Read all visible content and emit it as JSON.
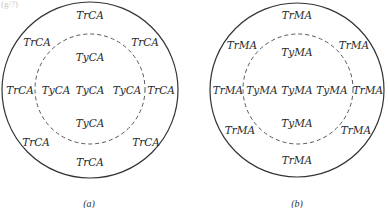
{
  "header_fragment": "(g/?)",
  "panels": [
    {
      "caption": "(a)",
      "outer_label": "TrCA",
      "inner_label": "TyCA",
      "outer_labels": [
        "TrCA",
        "TrCA",
        "TrCA",
        "TrCA",
        "TrCA",
        "TrCA",
        "TrCA",
        "TrCA"
      ],
      "inner_labels": [
        "TyCA",
        "TyCA",
        "TyCA",
        "TyCA",
        "TyCA"
      ]
    },
    {
      "caption": "(b)",
      "outer_label": "TrMA",
      "inner_label": "TyMA",
      "outer_labels": [
        "TrMA",
        "TrMA",
        "TrMA",
        "TrMA",
        "TrMA",
        "TrMA",
        "TrMA",
        "TrMA"
      ],
      "inner_labels": [
        "TyMA",
        "TyMA",
        "TyMA",
        "TyMA",
        "TyMA"
      ]
    }
  ]
}
